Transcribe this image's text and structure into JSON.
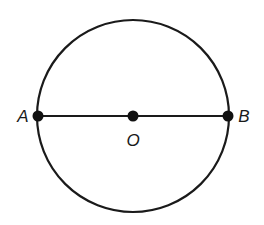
{
  "diagram": {
    "type": "circle-with-diameter",
    "circle": {
      "cx": 133,
      "cy": 116,
      "r": 96,
      "stroke": "#1a1a1a"
    },
    "diameter": {
      "from": "A",
      "to": "B"
    },
    "points": [
      {
        "id": "A",
        "label": "A",
        "x": 38,
        "y": 116,
        "label_x": 23,
        "label_y": 122
      },
      {
        "id": "O",
        "label": "O",
        "x": 133,
        "y": 116,
        "label_x": 133,
        "label_y": 146
      },
      {
        "id": "B",
        "label": "B",
        "x": 228,
        "y": 116,
        "label_x": 244,
        "label_y": 122
      }
    ],
    "colors": {
      "ink": "#1a1a1a",
      "background": "#ffffff"
    }
  }
}
